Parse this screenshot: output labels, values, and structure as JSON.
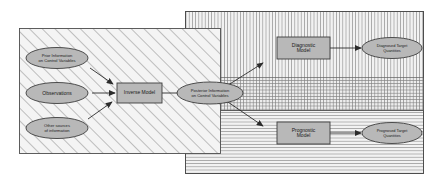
{
  "diagram": {
    "panels": [
      {
        "name": "input-panel",
        "fill": "diagonal-hatch",
        "label": ""
      },
      {
        "name": "diagnostic-panel",
        "fill": "vertical-hatch",
        "label": ""
      },
      {
        "name": "prognostic-panel",
        "fill": "horizontal-hatch",
        "label": ""
      }
    ],
    "nodes": {
      "prior": {
        "label": "Prior Information\non Control Variables",
        "shape": "ellipse"
      },
      "observations": {
        "label": "Observations",
        "shape": "ellipse"
      },
      "other": {
        "label": "Other sources\nof information",
        "shape": "ellipse"
      },
      "inverse_model": {
        "label": "Inverse Model",
        "shape": "rect"
      },
      "posterior": {
        "label": "Posterior Information\non Control Variables",
        "shape": "ellipse"
      },
      "diagnostic_model": {
        "label": "Diagnostic\nModel",
        "shape": "rect"
      },
      "prognostic_model": {
        "label": "Prognostic\nModel",
        "shape": "rect"
      },
      "diagnosed_target": {
        "label": "Diagnosed Target\nQuantities",
        "shape": "ellipse"
      },
      "prognosed_target": {
        "label": "Prognosed Target\nQuantities",
        "shape": "ellipse"
      }
    },
    "edges": [
      {
        "from": "prior",
        "to": "inverse_model"
      },
      {
        "from": "observations",
        "to": "inverse_model"
      },
      {
        "from": "other",
        "to": "inverse_model"
      },
      {
        "from": "inverse_model",
        "to": "posterior"
      },
      {
        "from": "posterior",
        "to": "diagnostic_model"
      },
      {
        "from": "posterior",
        "to": "prognostic_model"
      },
      {
        "from": "diagnostic_model",
        "to": "diagnosed_target"
      },
      {
        "from": "prognostic_model",
        "to": "prognosed_target"
      }
    ],
    "colors": {
      "stroke": "#4d4d4d",
      "node_fill": "#b8b8b8",
      "hatch": "#8c8c8c",
      "panel_bg": "#f2f2f2",
      "text": "#1a1a1a"
    }
  }
}
